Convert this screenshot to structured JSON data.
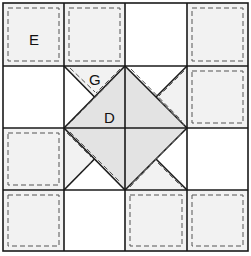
{
  "labels": {
    "E": "E",
    "G": "G",
    "D": "D"
  },
  "colors": {
    "line": "#1a1a1a",
    "dash": "#555555",
    "patch_light": "#f2f2f2",
    "diamond": "#e3e3e3",
    "background": "#ffffff"
  },
  "grid": {
    "cols": 4,
    "rows": 4,
    "col_edges": [
      3,
      64,
      125,
      187,
      248
    ],
    "row_edges": [
      3,
      66,
      128,
      190,
      251
    ]
  },
  "patches": [
    {
      "row": 0,
      "col": 0,
      "label": "E"
    },
    {
      "row": 0,
      "col": 1
    },
    {
      "row": 0,
      "col": 3
    },
    {
      "row": 1,
      "col": 3
    },
    {
      "row": 2,
      "col": 0
    },
    {
      "row": 3,
      "col": 0
    },
    {
      "row": 3,
      "col": 2
    },
    {
      "row": 3,
      "col": 3
    }
  ],
  "center_star": {
    "diamond_label": "D",
    "goose_label": "G"
  }
}
